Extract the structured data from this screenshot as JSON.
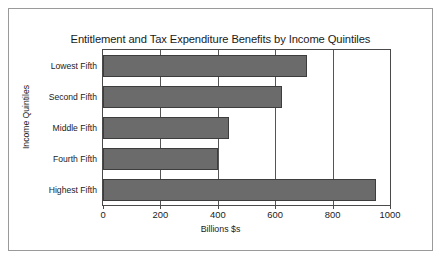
{
  "chart_data": {
    "type": "bar",
    "orientation": "horizontal",
    "title": "Entitlement and Tax Expenditure Benefits by Income Quintiles",
    "xlabel": "Billions $s",
    "ylabel": "Income Quintiles",
    "categories": [
      "Lowest Fifth",
      "Second Fifth",
      "Middle Fifth",
      "Fourth Fifth",
      "Highest Fifth"
    ],
    "values": [
      710,
      625,
      440,
      400,
      950
    ],
    "xlim": [
      0,
      1000
    ],
    "xticks": [
      0,
      200,
      400,
      600,
      800,
      1000
    ],
    "xtick_labels": [
      "0",
      "200",
      "400",
      "600",
      "800",
      "1000"
    ],
    "grid": true,
    "legend": false,
    "series": [
      {
        "name": "Benefits",
        "values": [
          710,
          625,
          440,
          400,
          950
        ]
      }
    ],
    "colors": {
      "bar_fill": "#6b6b6b",
      "bar_edge": "#3d3d3d",
      "axis": "#4a4a4a",
      "gridline": "#555555",
      "text": "#1b1b1b",
      "background": "#ffffff",
      "frame_border": "#9a9a9a"
    }
  }
}
